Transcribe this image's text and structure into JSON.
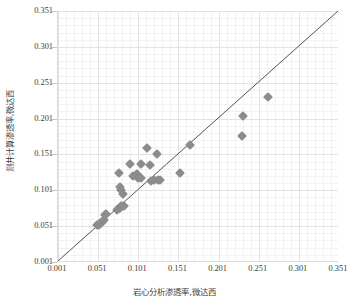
{
  "chart_data": {
    "type": "scatter",
    "title": "",
    "xlabel": "岩心分析渗透率,微达西",
    "ylabel": "测井计算渗透率,微达西",
    "xlim": [
      0.001,
      0.351
    ],
    "ylim": [
      0.001,
      0.351
    ],
    "xticks": [
      "0.001",
      "0.051",
      "0.101",
      "0.151",
      "0.201",
      "0.251",
      "0.301",
      "0.351"
    ],
    "yticks": [
      "0.001",
      "0.051",
      "0.101",
      "0.151",
      "0.201",
      "0.251",
      "0.301",
      "0.351"
    ],
    "xtick_values": [
      0.001,
      0.051,
      0.101,
      0.151,
      0.201,
      0.251,
      0.301,
      0.351
    ],
    "ytick_values": [
      0.001,
      0.051,
      0.101,
      0.151,
      0.201,
      0.251,
      0.301,
      0.351
    ],
    "grid": true,
    "minor_grid": true,
    "legend": false,
    "marker": "diamond",
    "marker_color": "#8c8c8c",
    "reference_line": {
      "name": "1:1 identity line",
      "color": "#404040",
      "from": [
        0.001,
        0.001
      ],
      "to": [
        0.351,
        0.351
      ]
    },
    "points": [
      [
        0.05,
        0.052
      ],
      [
        0.052,
        0.053
      ],
      [
        0.053,
        0.055
      ],
      [
        0.055,
        0.056
      ],
      [
        0.056,
        0.057
      ],
      [
        0.058,
        0.059
      ],
      [
        0.06,
        0.066
      ],
      [
        0.061,
        0.068
      ],
      [
        0.074,
        0.073
      ],
      [
        0.076,
        0.075
      ],
      [
        0.078,
        0.076
      ],
      [
        0.079,
        0.079
      ],
      [
        0.081,
        0.079
      ],
      [
        0.083,
        0.079
      ],
      [
        0.079,
        0.101
      ],
      [
        0.078,
        0.106
      ],
      [
        0.082,
        0.096
      ],
      [
        0.077,
        0.125
      ],
      [
        0.091,
        0.138
      ],
      [
        0.094,
        0.121
      ],
      [
        0.098,
        0.122
      ],
      [
        0.1,
        0.124
      ],
      [
        0.101,
        0.118
      ],
      [
        0.104,
        0.137
      ],
      [
        0.104,
        0.118
      ],
      [
        0.112,
        0.16
      ],
      [
        0.116,
        0.136
      ],
      [
        0.117,
        0.114
      ],
      [
        0.121,
        0.115
      ],
      [
        0.124,
        0.151
      ],
      [
        0.126,
        0.116
      ],
      [
        0.128,
        0.115
      ],
      [
        0.153,
        0.125
      ],
      [
        0.165,
        0.164
      ],
      [
        0.23,
        0.177
      ],
      [
        0.231,
        0.204
      ],
      [
        0.262,
        0.231
      ]
    ]
  },
  "axes": {
    "y_title": "测井计算渗透率,微达西",
    "x_title": "岩心分析渗透率,微达西"
  }
}
